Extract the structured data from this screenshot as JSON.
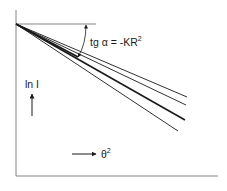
{
  "diagram": {
    "annotation": {
      "prefix": "tg α = -KR",
      "superscript": "2"
    },
    "y_axis_label": "ln I",
    "x_axis_label": "θ",
    "x_axis_superscript": "2",
    "colors": {
      "line": "#1a1a1a",
      "axis": "#555555",
      "background": "#ffffff"
    },
    "lines": [
      {
        "name": "line-1",
        "x1": 16,
        "y1": 24,
        "x2": 187,
        "y2": 97,
        "width": 0.9
      },
      {
        "name": "line-2",
        "x1": 16,
        "y1": 24,
        "x2": 186,
        "y2": 105,
        "width": 0.9
      },
      {
        "name": "line-3-thick",
        "x1": 16,
        "y1": 24,
        "x2": 185,
        "y2": 120,
        "width": 1.6
      },
      {
        "name": "line-4",
        "x1": 16,
        "y1": 24,
        "x2": 178,
        "y2": 131,
        "width": 0.9
      }
    ]
  }
}
